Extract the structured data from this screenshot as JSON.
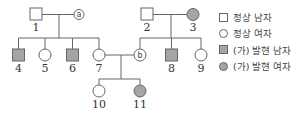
{
  "colors": {
    "affected": "#a5a5a5",
    "normal": "#ffffff",
    "stroke": "#666666"
  },
  "pedigree": {
    "individuals": [
      {
        "id": "1",
        "sex": "male",
        "affected": false,
        "label": "1"
      },
      {
        "id": "a",
        "sex": "female",
        "affected": false,
        "label": "ⓐ",
        "tag": "a"
      },
      {
        "id": "2",
        "sex": "male",
        "affected": false,
        "label": "2"
      },
      {
        "id": "3",
        "sex": "female",
        "affected": true,
        "label": "3"
      },
      {
        "id": "4",
        "sex": "male",
        "affected": true,
        "label": "4"
      },
      {
        "id": "5",
        "sex": "female",
        "affected": false,
        "label": "5"
      },
      {
        "id": "6",
        "sex": "male",
        "affected": true,
        "label": "6"
      },
      {
        "id": "7",
        "sex": "female",
        "affected": false,
        "label": "7"
      },
      {
        "id": "b",
        "sex": "female",
        "affected": false,
        "label": "ⓑ",
        "tag": "b"
      },
      {
        "id": "8",
        "sex": "male",
        "affected": true,
        "label": "8"
      },
      {
        "id": "9",
        "sex": "female",
        "affected": false,
        "label": "9"
      },
      {
        "id": "10",
        "sex": "female",
        "affected": false,
        "label": "10"
      },
      {
        "id": "11",
        "sex": "female",
        "affected": true,
        "label": "11"
      }
    ],
    "labels": {
      "n1": "1",
      "n2": "2",
      "n3": "3",
      "n4": "4",
      "n5": "5",
      "n6": "6",
      "n7": "7",
      "n8": "8",
      "n9": "9",
      "n10": "10",
      "n11": "11",
      "a": "a",
      "b": "b"
    }
  },
  "legend": {
    "items": [
      {
        "icon": "square-empty",
        "label": "정상 남자"
      },
      {
        "icon": "circle-empty",
        "label": "정상 여자"
      },
      {
        "icon": "square-filled",
        "label": "(가) 발현 남자"
      },
      {
        "icon": "circle-filled",
        "label": "(가) 발현 여자"
      }
    ]
  }
}
